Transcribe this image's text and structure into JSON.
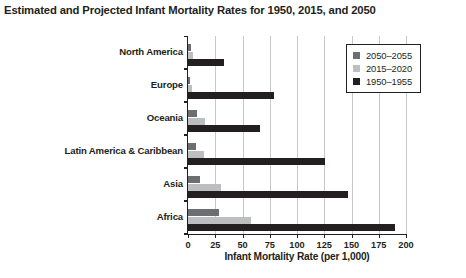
{
  "chart_data": {
    "type": "bar",
    "orientation": "horizontal",
    "title": "Estimated and Projected Infant Mortality Rates for 1950, 2015, and 2050",
    "xlabel": "Infant Mortality Rate (per 1,000)",
    "ylabel": "",
    "xlim": [
      0,
      200
    ],
    "xticks": [
      0,
      25,
      50,
      75,
      100,
      125,
      150,
      175,
      200
    ],
    "xtick_labels": [
      "0",
      "25",
      "50",
      "75",
      "100",
      "125",
      "150",
      "175",
      "200"
    ],
    "grid": "vertical",
    "legend_position": "top-right",
    "categories": [
      "North America",
      "Europe",
      "Oceania",
      "Latin America & Caribbean",
      "Asia",
      "Africa"
    ],
    "series": [
      {
        "name": "2050–2055",
        "color": "#6d6e71",
        "values": [
          3,
          2,
          8,
          7,
          11,
          28
        ]
      },
      {
        "name": "2015–2020",
        "color": "#bcbec0",
        "values": [
          5,
          4,
          16,
          15,
          30,
          58
        ]
      },
      {
        "name": "1950–1955",
        "color": "#231f20",
        "values": [
          33,
          79,
          66,
          126,
          147,
          190
        ]
      }
    ]
  },
  "colors": {
    "series_2050": "#6d6e71",
    "series_2015": "#bcbec0",
    "series_1950": "#231f20",
    "axis": "#231f20",
    "gridline": "#c9c9c9",
    "background": "#ffffff"
  }
}
